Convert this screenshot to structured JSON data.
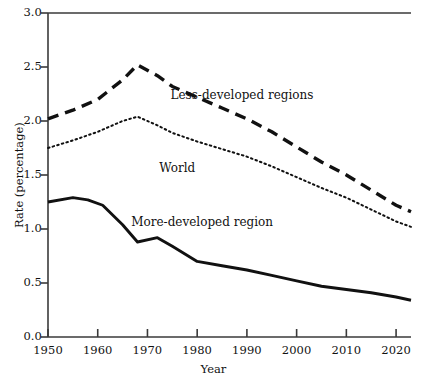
{
  "chart_data": {
    "type": "line",
    "title": "",
    "xlabel": "Year",
    "ylabel": "Rate (percentage)",
    "xlim": [
      1950,
      2023
    ],
    "ylim": [
      0.0,
      3.0
    ],
    "grid": false,
    "legend_position": "inline-annotations",
    "x_ticks": [
      1950,
      1960,
      1970,
      1980,
      1990,
      2000,
      2010,
      2020
    ],
    "x_tick_labels": [
      "1950",
      "1960",
      "1970",
      "1980",
      "1990",
      "2000",
      "2010",
      "2020"
    ],
    "y_ticks": [
      0.0,
      0.5,
      1.0,
      1.5,
      2.0,
      2.5,
      3.0
    ],
    "y_tick_labels": [
      "0.0",
      "0.5",
      "1.0",
      "1.5",
      "2.0",
      "2.5",
      "3.0"
    ],
    "series": [
      {
        "name": "Less-developed regions",
        "style": "dashed",
        "color": "#111111",
        "x": [
          1950,
          1955,
          1960,
          1965,
          1968,
          1972,
          1975,
          1980,
          1985,
          1990,
          1995,
          2000,
          2005,
          2010,
          2015,
          2020,
          2023
        ],
        "values": [
          2.02,
          2.1,
          2.2,
          2.38,
          2.52,
          2.42,
          2.32,
          2.22,
          2.12,
          2.02,
          1.9,
          1.76,
          1.62,
          1.5,
          1.36,
          1.22,
          1.16
        ]
      },
      {
        "name": "World",
        "style": "dotted",
        "color": "#111111",
        "x": [
          1950,
          1955,
          1960,
          1965,
          1968,
          1972,
          1975,
          1980,
          1985,
          1990,
          1995,
          2000,
          2005,
          2010,
          2015,
          2020,
          2023
        ],
        "values": [
          1.75,
          1.82,
          1.9,
          2.0,
          2.04,
          1.96,
          1.89,
          1.81,
          1.74,
          1.67,
          1.58,
          1.48,
          1.38,
          1.29,
          1.18,
          1.07,
          1.02
        ]
      },
      {
        "name": "More-developed region",
        "style": "solid",
        "color": "#111111",
        "x": [
          1950,
          1955,
          1958,
          1961,
          1965,
          1968,
          1972,
          1975,
          1980,
          1985,
          1990,
          1995,
          2000,
          2005,
          2010,
          2015,
          2020,
          2023
        ],
        "values": [
          1.25,
          1.29,
          1.27,
          1.22,
          1.04,
          0.88,
          0.92,
          0.84,
          0.7,
          0.66,
          0.62,
          0.57,
          0.52,
          0.47,
          0.44,
          0.41,
          0.37,
          0.34
        ]
      }
    ],
    "annotations": [
      {
        "text": "Less-developed regions",
        "x": 1989,
        "y": 2.23
      },
      {
        "text": "World",
        "x": 1976,
        "y": 1.56
      },
      {
        "text": "More-developed region",
        "x": 1981,
        "y": 1.06
      }
    ]
  }
}
